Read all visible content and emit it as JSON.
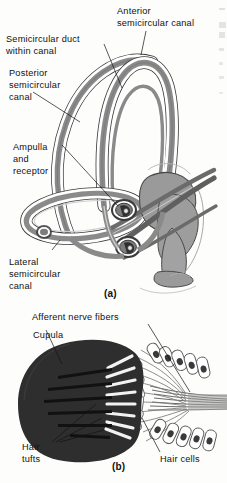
{
  "figure": {
    "title_implicit": "Semicircular canals and crista ampullaris",
    "panels": [
      {
        "id": "a",
        "caption": "(a)",
        "labels": [
          {
            "name": "anterior-semicircular-canal",
            "lines": [
              "Anterior",
              "semicircular canal"
            ]
          },
          {
            "name": "semicircular-duct-within-canal",
            "lines": [
              "Semicircular duct",
              "within canal"
            ]
          },
          {
            "name": "posterior-semicircular-canal",
            "lines": [
              "Posterior",
              "semicircular",
              "canal"
            ]
          },
          {
            "name": "ampulla-and-receptor",
            "lines": [
              "Ampulla",
              "and",
              "receptor"
            ]
          },
          {
            "name": "lateral-semicircular-canal",
            "lines": [
              "Lateral",
              "semicircular",
              "canal"
            ]
          }
        ]
      },
      {
        "id": "b",
        "caption": "(b)",
        "labels": [
          {
            "name": "afferent-nerve-fibers",
            "lines": [
              "Afferent nerve fibers"
            ]
          },
          {
            "name": "cupula",
            "lines": [
              "Cupula"
            ]
          },
          {
            "name": "hair-tufts",
            "lines": [
              "Hair",
              "tufts"
            ]
          },
          {
            "name": "hair-cells",
            "lines": [
              "Hair cells"
            ]
          }
        ]
      }
    ],
    "text": {
      "anterior_1": "Anterior",
      "anterior_2": "semicircular canal",
      "duct_1": "Semicircular duct",
      "duct_2": "within canal",
      "posterior_1": "Posterior",
      "posterior_2": "semicircular",
      "posterior_3": "canal",
      "ampulla_1": "Ampulla",
      "ampulla_2": "and",
      "ampulla_3": "receptor",
      "lateral_1": "Lateral",
      "lateral_2": "semicircular",
      "lateral_3": "canal",
      "caption_a": "(a)",
      "afferent": "Afferent nerve fibers",
      "cupula": "Cupula",
      "hair_tufts_1": "Hair",
      "hair_tufts_2": "tufts",
      "hair_cells": "Hair cells",
      "caption_b": "(b)"
    },
    "colors": {
      "page_background": "#fdfdfb",
      "duct_gray": "#8a8a8a",
      "duct_gray_dark": "#6f6f6f",
      "canal_white": "#ffffff",
      "outline": "#3a3a3a",
      "cupula_dark": "#2e2e2e",
      "nerve_gray": "#9a9a9a",
      "label_text": "#111111"
    }
  }
}
